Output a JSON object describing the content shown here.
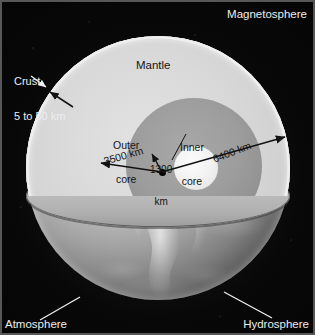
{
  "figure": {
    "background_color": "#0a0a0a"
  },
  "labels": {
    "magnetosphere": "Magnetosphere",
    "atmosphere": "Atmosphere",
    "hydrosphere": "Hydrosphere",
    "crust_line1": "Crust",
    "crust_line2": "5 to 50 km",
    "mantle": "Mantle",
    "outer_core_line1": "Outer",
    "outer_core_line2": "core",
    "inner_core_line1": "Inner",
    "inner_core_line2": "core",
    "radius_inner_line1": "1300",
    "radius_inner_line2": "km",
    "radius_outer_core": "3500 km",
    "radius_earth": "6400 km"
  },
  "layers": [
    {
      "name": "crust",
      "label": "Crust",
      "thickness": "5 to 50 km",
      "color": "#efefef"
    },
    {
      "name": "mantle",
      "label": "Mantle",
      "radius": "6400 km",
      "color": "#d9d9d9"
    },
    {
      "name": "outer-core",
      "label": "Outer core",
      "radius": "3500 km",
      "color": "#9d9d9d"
    },
    {
      "name": "inner-core",
      "label": "Inner core",
      "radius": "1300 km",
      "color": "#f2f2f2"
    }
  ],
  "spheres": [
    {
      "name": "magnetosphere",
      "label": "Magnetosphere",
      "position": "top-right"
    },
    {
      "name": "atmosphere",
      "label": "Atmosphere",
      "position": "bottom-left"
    },
    {
      "name": "hydrosphere",
      "label": "Hydrosphere",
      "position": "bottom-right"
    }
  ],
  "measurements": [
    {
      "name": "inner-core-radius",
      "value": "1300 km",
      "from": "center",
      "to": "inner core boundary"
    },
    {
      "name": "outer-core-radius",
      "value": "3500 km",
      "from": "center",
      "to": "outer core boundary"
    },
    {
      "name": "earth-radius",
      "value": "6400 km",
      "from": "center",
      "to": "surface"
    }
  ],
  "colors": {
    "space": "#0a0a0a",
    "halo": "#ebebeb",
    "mantle": "#d9d9d9",
    "outer_core": "#9d9d9d",
    "inner_core": "#f2f2f2",
    "cut_plane": "#bdbdbd",
    "annotation": "#141414",
    "label_light": "#ededed"
  }
}
